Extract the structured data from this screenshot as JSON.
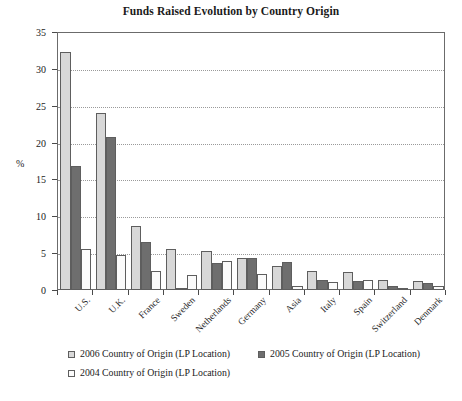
{
  "chart_data": {
    "type": "bar",
    "title": "Funds Raised Evolution by Country Origin",
    "xlabel": "",
    "ylabel": "%",
    "ylim": [
      0,
      35
    ],
    "yticks": [
      0,
      5,
      10,
      15,
      20,
      25,
      30,
      35
    ],
    "grid": true,
    "legend_position": "bottom-left",
    "categories": [
      "U.S.",
      "U.K.",
      "France",
      "Sweden",
      "Netherlands",
      "Germany",
      "Asia",
      "Italy",
      "Spain",
      "Switzerland",
      "Denmark"
    ],
    "series": [
      {
        "name": "2006 Country of Origin (LP Location)",
        "color": "#d8d8d8",
        "values": [
          32.3,
          24.0,
          8.7,
          5.5,
          5.3,
          4.3,
          3.2,
          2.6,
          2.5,
          1.3,
          1.2
        ]
      },
      {
        "name": "2005 Country of Origin (LP Location)",
        "color": "#6e6e6e",
        "values": [
          16.8,
          20.7,
          6.5,
          0.3,
          3.6,
          4.3,
          3.8,
          1.3,
          1.2,
          0.5,
          1.0
        ]
      },
      {
        "name": "2004 Country of Origin (LP Location)",
        "color": "#fbfbfb",
        "values": [
          5.5,
          4.8,
          2.6,
          2.0,
          4.0,
          2.2,
          0.6,
          1.1,
          1.4,
          0.2,
          0.5
        ]
      }
    ]
  },
  "legend": {
    "items": [
      {
        "label": "2006 Country of Origin (LP Location)"
      },
      {
        "label": "2005 Country of Origin (LP Location)"
      },
      {
        "label": "2004 Country of Origin (LP Location)"
      }
    ]
  },
  "axis": {
    "y_title": "%",
    "y_ticks": [
      "0",
      "5",
      "10",
      "15",
      "20",
      "25",
      "30",
      "35"
    ]
  }
}
